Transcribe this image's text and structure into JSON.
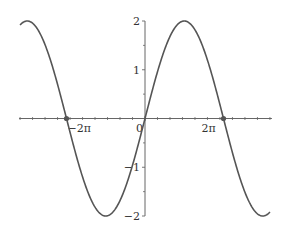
{
  "chart_data": {
    "type": "line",
    "title": "",
    "xlabel": "",
    "ylabel": "",
    "function": "y = 2 sin(x/2)",
    "xlim": [
      -10,
      10
    ],
    "ylim": [
      -2,
      2
    ],
    "grid": false,
    "legend": null,
    "x_ticks": [
      {
        "value": -6.2832,
        "label": "−2π"
      },
      {
        "value": 0,
        "label": "0"
      },
      {
        "value": 6.2832,
        "label": "2π"
      }
    ],
    "x_minor_ticks": [
      -10,
      -9,
      -8,
      -7,
      -6,
      -5,
      -4,
      -3,
      -2,
      -1,
      1,
      2,
      3,
      4,
      5,
      6,
      7,
      8,
      9,
      10
    ],
    "y_ticks": [
      {
        "value": 2,
        "label": "2"
      },
      {
        "value": 1,
        "label": "1"
      },
      {
        "value": -1,
        "label": "−1"
      },
      {
        "value": -2,
        "label": "−2"
      }
    ],
    "y_minor_ticks": [
      1.5,
      0.5,
      -0.5,
      -1.5
    ],
    "highlighted_points": [
      {
        "x": -6.2832,
        "y": 0
      },
      {
        "x": 6.2832,
        "y": 0
      }
    ],
    "series": [
      {
        "name": "2 sin(x/2)",
        "x": [
          -10,
          -9.4248,
          -8,
          -6.2832,
          -4,
          -3.1416,
          -2,
          0,
          2,
          3.1416,
          4,
          6.2832,
          8,
          9.4248,
          10
        ],
        "values": [
          1.918,
          2.0,
          1.514,
          0.0,
          -1.819,
          -2.0,
          -1.683,
          0.0,
          1.683,
          2.0,
          1.819,
          0.0,
          -1.514,
          -2.0,
          -1.918
        ]
      }
    ]
  },
  "style": {
    "curve_color": "#555555",
    "axis_color": "#666666",
    "point_color": "#555555"
  }
}
